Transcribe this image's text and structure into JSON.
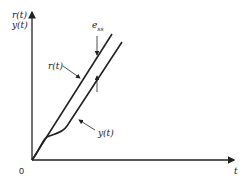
{
  "diagram": {
    "type": "ramp-response-steady-state-error",
    "y_axis_labels": [
      "r(t)",
      "y(t)"
    ],
    "x_axis_label": "t",
    "origin_label": "0",
    "curves": [
      {
        "name": "reference-input",
        "label": "r(t)"
      },
      {
        "name": "output-response",
        "label": "y(t)"
      }
    ],
    "error_label": {
      "base": "e",
      "sub": "ss"
    }
  }
}
